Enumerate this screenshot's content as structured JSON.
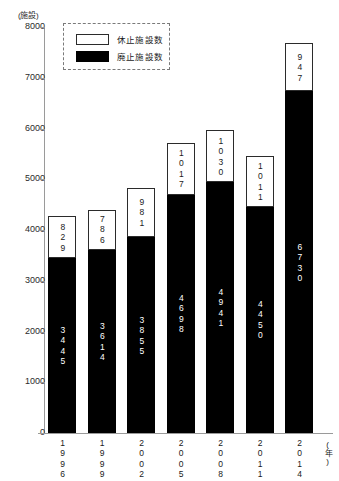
{
  "chart_data": {
    "type": "bar",
    "subtype": "stacked-vertical",
    "title": "",
    "xlabel": "(年)",
    "ylabel": "(施設)",
    "categories": [
      "1996",
      "1999",
      "2002",
      "2005",
      "2008",
      "2011",
      "2014"
    ],
    "series": [
      {
        "name": "廃止施設数",
        "color": "#000000",
        "values": [
          3445,
          3614,
          3855,
          4698,
          4941,
          4450,
          6730
        ]
      },
      {
        "name": "休止施設数",
        "color": "#ffffff",
        "values": [
          829,
          786,
          981,
          1017,
          1030,
          1011,
          947
        ]
      }
    ],
    "totals": [
      4274,
      4400,
      4836,
      5715,
      5971,
      5461,
      7677
    ],
    "ylim": [
      0,
      8000
    ],
    "y_ticks": [
      "0",
      "1000",
      "2000",
      "3000",
      "4000",
      "5000",
      "6000",
      "7000",
      "8000"
    ],
    "y_tick_values": [
      0,
      1000,
      2000,
      3000,
      4000,
      5000,
      6000,
      7000,
      8000
    ],
    "grid": false,
    "legend_position": "top-left-inside"
  },
  "axis": {
    "y_unit": "(施設)",
    "x_unit": "(年)",
    "ticks": [
      {
        "label": "8000",
        "value": 8000
      },
      {
        "label": "7000",
        "value": 7000
      },
      {
        "label": "6000",
        "value": 6000
      },
      {
        "label": "5000",
        "value": 5000
      },
      {
        "label": "4000",
        "value": 4000
      },
      {
        "label": "3000",
        "value": 3000
      },
      {
        "label": "2000",
        "value": 2000
      },
      {
        "label": "1000",
        "value": 1000
      },
      {
        "label": "0",
        "value": 0
      }
    ]
  },
  "legend": {
    "items": [
      {
        "label": "休止施設数",
        "swatch": "white"
      },
      {
        "label": "廃止施設数",
        "swatch": "black"
      }
    ]
  },
  "bars": [
    {
      "year": "1996",
      "bottom_label": "3445",
      "top_label": "829",
      "bottom": 3445,
      "top": 829
    },
    {
      "year": "1999",
      "bottom_label": "3614",
      "top_label": "786",
      "bottom": 3614,
      "top": 786
    },
    {
      "year": "2002",
      "bottom_label": "3855",
      "top_label": "981",
      "bottom": 3855,
      "top": 981
    },
    {
      "year": "2005",
      "bottom_label": "4698",
      "top_label": "1017",
      "bottom": 4698,
      "top": 1017
    },
    {
      "year": "2008",
      "bottom_label": "4941",
      "top_label": "1030",
      "bottom": 4941,
      "top": 1030
    },
    {
      "year": "2011",
      "bottom_label": "4450",
      "top_label": "1011",
      "bottom": 4450,
      "top": 1011
    },
    {
      "year": "2014",
      "bottom_label": "6730",
      "top_label": "947",
      "bottom": 6730,
      "top": 947
    }
  ],
  "colors": {
    "bottom_fill": "#000000",
    "top_fill": "#ffffff",
    "outline": "#2b2b2b",
    "axis": "#9a9a9a",
    "legend_border": "#7a7a7a"
  }
}
